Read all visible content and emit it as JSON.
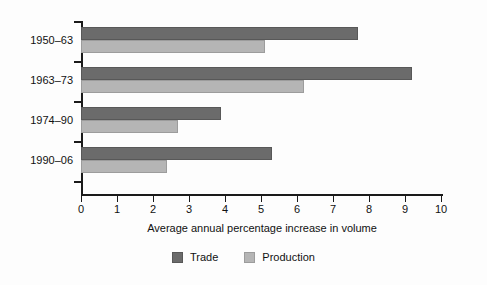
{
  "chart_data": {
    "type": "bar",
    "orientation": "horizontal",
    "title": "",
    "xlabel": "Average annual percentage increase in volume",
    "ylabel": "",
    "xlim": [
      0,
      10
    ],
    "xticks": [
      0,
      1,
      2,
      3,
      4,
      5,
      6,
      7,
      8,
      9,
      10
    ],
    "xtick_labels": [
      "0",
      "1",
      "2",
      "3",
      "4",
      "5",
      "6",
      "7",
      "8",
      "9",
      "10"
    ],
    "grid": false,
    "legend_position": "bottom-center",
    "categories": [
      "1950–63",
      "1963–73",
      "1974–90",
      "1990–06"
    ],
    "series": [
      {
        "name": "Trade",
        "color": "#6b6b6b",
        "values": [
          7.7,
          9.2,
          3.9,
          5.3
        ]
      },
      {
        "name": "Production",
        "color": "#b5b5b5",
        "values": [
          5.1,
          6.2,
          2.7,
          2.4
        ]
      }
    ]
  },
  "legend": {
    "items": [
      {
        "label": "Trade"
      },
      {
        "label": "Production"
      }
    ]
  }
}
